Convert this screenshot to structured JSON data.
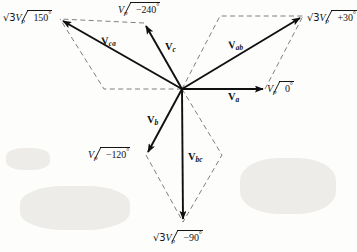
{
  "figure": {
    "origin": {
      "x": 182,
      "y": 89
    },
    "stroke_color": "#101010",
    "dash_color": "#6b6b6b",
    "background": "#fdfdfc"
  },
  "phasors": [
    {
      "id": "Va",
      "name": "V_a",
      "label_main": "V",
      "label_sub": "a",
      "label_x": 228,
      "label_y": 96,
      "tip_x": 265,
      "tip_y": 89,
      "angle_deg": 0,
      "kind": "phase"
    },
    {
      "id": "Vb",
      "name": "V_b",
      "label_main": "V",
      "label_sub": "b",
      "label_x": 148,
      "label_y": 120,
      "tip_x": 146,
      "tip_y": 155,
      "angle_deg": -120,
      "kind": "phase"
    },
    {
      "id": "Vc",
      "name": "V_c",
      "label_main": "V",
      "label_sub": "c",
      "label_x": 152,
      "label_y": 45,
      "tip_x": 144,
      "tip_y": 23,
      "angle_deg": 120,
      "kind": "phase"
    },
    {
      "id": "Vab",
      "name": "V_ab",
      "label_main": "V",
      "label_sub": "ab",
      "label_x": 232,
      "label_y": 43,
      "tip_x": 303,
      "tip_y": 16,
      "angle_deg": 30,
      "kind": "line"
    },
    {
      "id": "Vbc",
      "name": "V_bc",
      "label_main": "V",
      "label_sub": "bc",
      "label_x": 187,
      "label_y": 159,
      "tip_x": 183,
      "tip_y": 222,
      "angle_deg": -90,
      "kind": "line"
    },
    {
      "id": "Vca",
      "name": "V_ca",
      "label_main": "V",
      "label_sub": "ca",
      "label_x": 104,
      "label_y": 39,
      "tip_x": 60,
      "tip_y": 19,
      "angle_deg": 150,
      "kind": "line"
    }
  ],
  "axis_labels": [
    {
      "id": "label-vp-0",
      "magnitude": "V",
      "magnitude_sub": "p",
      "sqrt3": false,
      "angle_text": "0",
      "sign": "",
      "full_text": "Vp /0°",
      "x": 267,
      "y": 82
    },
    {
      "id": "label-vp-minus120",
      "magnitude": "V",
      "magnitude_sub": "p",
      "sqrt3": false,
      "angle_text": "120",
      "sign": "−",
      "full_text": "Vp /−120°",
      "x": 88,
      "y": 149
    },
    {
      "id": "label-vp-minus240",
      "magnitude": "V",
      "magnitude_sub": "p",
      "sqrt3": false,
      "angle_text": "240",
      "sign": "−",
      "full_text": "Vp /−240°",
      "x": 118,
      "y": 3
    },
    {
      "id": "label-sqrt3vp-plus30",
      "magnitude": "V",
      "magnitude_sub": "p",
      "sqrt3": true,
      "angle_text": "30",
      "sign": "+",
      "full_text": "√3Vp /+30°",
      "x": 307,
      "y": 11
    },
    {
      "id": "label-sqrt3vp-150",
      "magnitude": "V",
      "magnitude_sub": "p",
      "sqrt3": true,
      "angle_text": "150",
      "sign": "",
      "full_text": "√3Vp /150°",
      "x": 3,
      "y": 11
    },
    {
      "id": "label-sqrt3vp-minus90",
      "magnitude": "V",
      "magnitude_sub": "p",
      "sqrt3": true,
      "angle_text": "90",
      "sign": "−",
      "full_text": "√3Vp /−90°",
      "x": 153,
      "y": 231
    }
  ],
  "construction": {
    "description": "Dashed parallelogram construction lines for vector addition",
    "polylines": [
      {
        "id": "dash-ab-top",
        "points": "182,89 220,16 303,16"
      },
      {
        "id": "dash-ab-right",
        "points": "265,89 303,16"
      },
      {
        "id": "dash-ca-left",
        "points": "182,89 104,89 60,19"
      },
      {
        "id": "dash-ca-top",
        "points": "144,23 60,19"
      },
      {
        "id": "dash-bc-left",
        "points": "146,155 183,222"
      },
      {
        "id": "dash-bc-right",
        "points": "182,89 222,155 183,222"
      }
    ]
  }
}
